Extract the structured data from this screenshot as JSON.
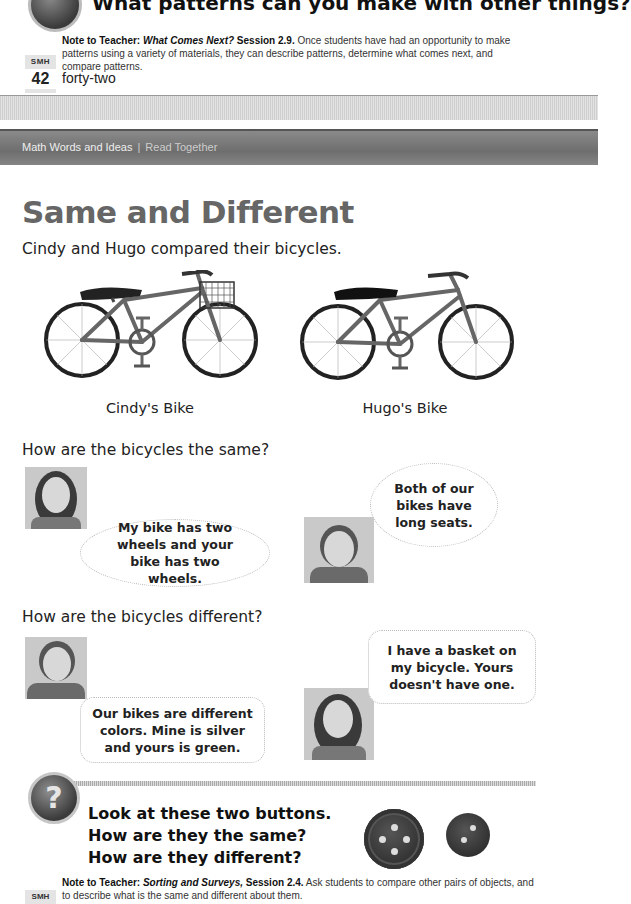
{
  "previous_page": {
    "question": "What patterns can you make with other things?",
    "note": {
      "label": "Note to Teacher:",
      "unit": "What Comes Next?",
      "session": "Session 2.9.",
      "text": "Once students have had an opportunity to make patterns using a variety of materials, they can describe patterns, determine what comes next, and compare patterns."
    },
    "tab": {
      "label": "SMH",
      "page_number": "42"
    },
    "page_word": "forty-two"
  },
  "header": {
    "section": "Math Words and Ideas",
    "separator": "|",
    "mode": "Read Together"
  },
  "page": {
    "title": "Same and Different",
    "intro": "Cindy and Hugo compared their bicycles.",
    "bikes": [
      {
        "caption": "Cindy's Bike",
        "has_basket": true
      },
      {
        "caption": "Hugo's Bike",
        "has_basket": false
      }
    ],
    "same": {
      "question": "How are the bicycles the same?",
      "cindy_says": "My bike has two wheels and your bike has two wheels.",
      "hugo_says": "Both of our bikes have long seats."
    },
    "different": {
      "question": "How are the bicycles different?",
      "hugo_says": "Our bikes are different colors. Mine is silver and yours is green.",
      "cindy_says": "I have a basket on my bicycle. Yours doesn't have one."
    },
    "prompt": {
      "line1": "Look at these two buttons.",
      "line2": "How are they the same?",
      "line3": "How are they different?",
      "buttons": [
        {
          "holes": 4,
          "size": "large"
        },
        {
          "holes": 2,
          "size": "small"
        }
      ]
    },
    "note": {
      "label": "Note to Teacher:",
      "unit": "Sorting and Surveys,",
      "session": "Session 2.4.",
      "text": "Ask students to compare other pairs of objects, and to describe what is the same and different about them."
    },
    "tab": {
      "label": "SMH"
    }
  }
}
